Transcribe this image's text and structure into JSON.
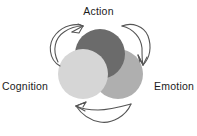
{
  "diagram": {
    "type": "venn-cycle",
    "title": "",
    "background_color": "#ffffff",
    "text_color": "#1b1b1b",
    "arrow_color": "#555555",
    "nodes": [
      {
        "id": "action",
        "label": "Action",
        "position": "top",
        "circle_color": "#6b6b6b",
        "cx": 100,
        "cy": 54,
        "r": 25,
        "stack_order": 2
      },
      {
        "id": "cognition",
        "label": "Cognition",
        "position": "bottom-left",
        "circle_color": "#d6d6d6",
        "cx": 83,
        "cy": 74,
        "r": 25,
        "stack_order": 3
      },
      {
        "id": "emotion",
        "label": "Emotion",
        "position": "bottom-right",
        "circle_color": "#afafaf",
        "cx": 118,
        "cy": 74,
        "r": 25,
        "stack_order": 1
      }
    ],
    "arrows": [
      {
        "id": "cognition-to-action",
        "from": "cognition",
        "to": "action",
        "direction": "up-right",
        "style": "curved-loop"
      },
      {
        "id": "action-to-emotion",
        "from": "action",
        "to": "emotion",
        "direction": "down-right",
        "style": "curved-loop"
      },
      {
        "id": "emotion-to-cognition",
        "from": "emotion",
        "to": "cognition",
        "direction": "left",
        "style": "curved-loop"
      }
    ],
    "cycle_direction": "clockwise"
  }
}
